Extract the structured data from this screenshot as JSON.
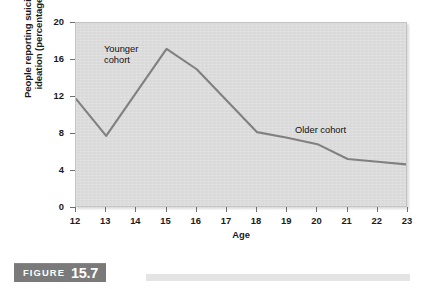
{
  "figure": {
    "caption_word": "FIGURE",
    "caption_number": "15.7"
  },
  "chart_data": {
    "type": "line",
    "title": "",
    "xlabel": "Age",
    "ylabel": "People reporting suicidal\nideation (percentage)",
    "x": [
      12,
      13,
      14,
      15,
      16,
      17,
      18,
      19,
      20,
      21,
      22,
      23
    ],
    "xtick_labels": [
      "12",
      "13",
      "14",
      "15",
      "16",
      "17",
      "18",
      "19",
      "20",
      "21",
      "22",
      "23"
    ],
    "ytick_labels": [
      "0",
      "4",
      "8",
      "12",
      "16",
      "20"
    ],
    "yticks": [
      0,
      4,
      8,
      12,
      16,
      20
    ],
    "xlim": [
      12,
      23
    ],
    "ylim": [
      0,
      20
    ],
    "grid": false,
    "legend": "none",
    "series": [
      {
        "name": "Suicidal ideation",
        "values": [
          11.8,
          7.8,
          12.5,
          17.2,
          15.0,
          11.6,
          8.2,
          7.6,
          6.9,
          5.3,
          5.0,
          4.7
        ],
        "color": "#808080"
      }
    ],
    "annotations": [
      {
        "id": "younger",
        "text": "Younger\ncohort",
        "x": 13.6,
        "y": 17.5
      },
      {
        "id": "older",
        "text": "Older cohort",
        "x": 19.3,
        "y": 9.3
      }
    ]
  }
}
